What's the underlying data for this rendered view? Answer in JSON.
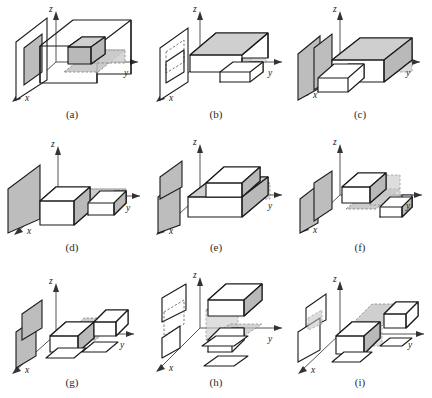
{
  "figure": {
    "kind": "multi-panel-diagram",
    "panel_count": 9,
    "grid": {
      "rows": 3,
      "cols": 3
    },
    "caption_partial": "",
    "axis_labels": {
      "x": "x",
      "y": "y",
      "z": "z"
    },
    "colors": {
      "outline": "#1b1b1b",
      "axis": "#555555",
      "shadow_fill": "#c2c2c2",
      "shadow_stroke": "#6f6f6f",
      "plane_fill": "#bdbdbd",
      "face_fill": "#b9b9b9",
      "background": "#ffffff",
      "label_text": "#2b2b2b"
    },
    "panels": [
      {
        "id": "a",
        "label": "(a)",
        "x_label": "x",
        "y_label": "y",
        "z_label": "z"
      },
      {
        "id": "b",
        "label": "(b)",
        "x_label": "x",
        "y_label": "y",
        "z_label": "z"
      },
      {
        "id": "c",
        "label": "(c)",
        "x_label": "x",
        "y_label": "y",
        "z_label": "z"
      },
      {
        "id": "d",
        "label": "(d)",
        "x_label": "x",
        "y_label": "y",
        "z_label": "z"
      },
      {
        "id": "e",
        "label": "(e)",
        "x_label": "x",
        "y_label": "y",
        "z_label": "z"
      },
      {
        "id": "f",
        "label": "(f)",
        "x_label": "x",
        "y_label": "y",
        "z_label": "z"
      },
      {
        "id": "g",
        "label": "(g)",
        "x_label": "x",
        "y_label": "y",
        "z_label": "z"
      },
      {
        "id": "h",
        "label": "(h)",
        "x_label": "x",
        "y_label": "y",
        "z_label": "z"
      },
      {
        "id": "i",
        "label": "(i)",
        "x_label": "x",
        "y_label": "y",
        "z_label": "z"
      }
    ]
  }
}
